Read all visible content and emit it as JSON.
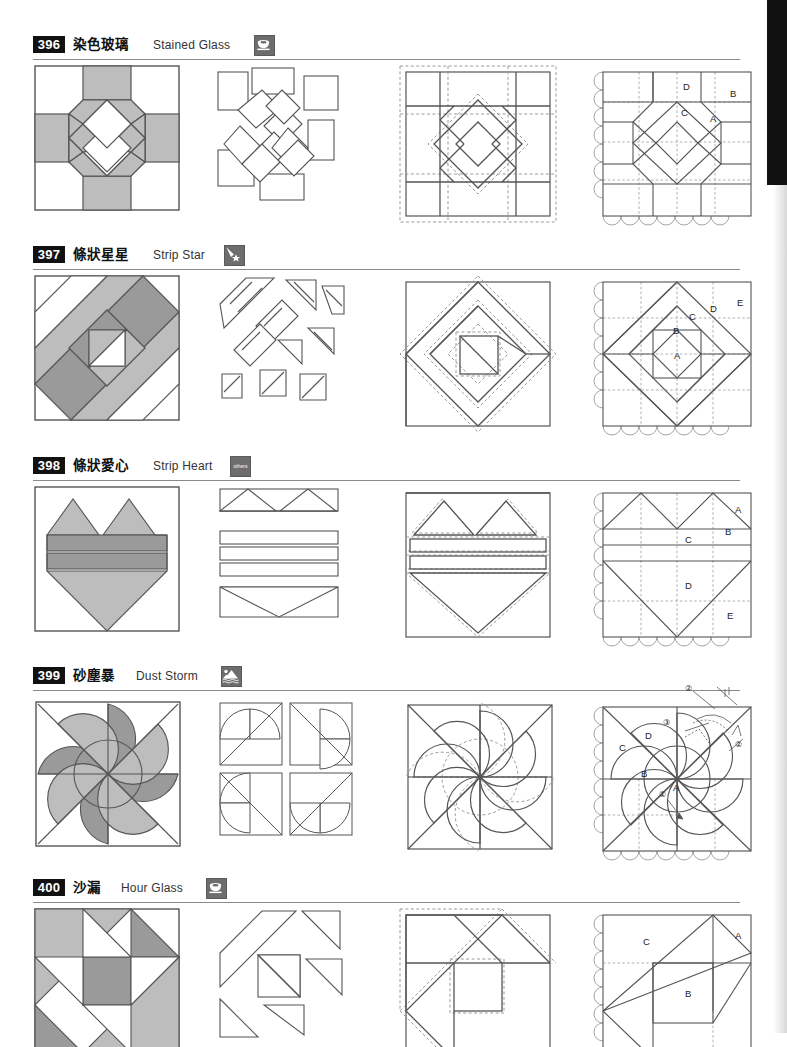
{
  "page": {
    "width": 787,
    "height": 1033,
    "edge_tab_color": "#111111",
    "palette": {
      "fill_light": "#ffffff",
      "fill_mid": "#bdbdbd",
      "fill_dark": "#9a9a9a",
      "fill_darker": "#8a8a8a",
      "outline": "#555555",
      "badge_bg": "#111111",
      "icon_bg": "#6d6d6d",
      "rule": "#8a8a8a",
      "dashed": "#9b9b9b"
    },
    "columns": [
      {
        "name": "finished-block",
        "caption": ""
      },
      {
        "name": "exploded-pieces",
        "caption": ""
      },
      {
        "name": "seam-allowance",
        "caption": ""
      },
      {
        "name": "labeled-template",
        "caption": ""
      }
    ]
  },
  "patterns": [
    {
      "number": "396",
      "name_cn": "染色玻璃",
      "name_en": "Stained Glass",
      "category_icon": "cup-icon",
      "category_label": "",
      "labels": [
        "A",
        "B",
        "C",
        "D"
      ],
      "step_marks": []
    },
    {
      "number": "397",
      "name_cn": "條狀星星",
      "name_en": "Strip Star",
      "category_icon": "shooting-star-icon",
      "category_label": "",
      "labels": [
        "A",
        "B",
        "C",
        "D",
        "E"
      ],
      "step_marks": []
    },
    {
      "number": "398",
      "name_cn": "條狀愛心",
      "name_en": "Strip Heart",
      "category_icon": "others-icon",
      "category_label": "others",
      "labels": [
        "A",
        "B",
        "C",
        "D",
        "E"
      ],
      "step_marks": []
    },
    {
      "number": "399",
      "name_cn": "砂塵暴",
      "name_en": "Dust Storm",
      "category_icon": "landscape-icon",
      "category_label": "",
      "labels": [
        "A",
        "B",
        "C",
        "D"
      ],
      "step_marks": [
        "①",
        "②",
        "②",
        "③"
      ]
    },
    {
      "number": "400",
      "name_cn": "沙漏",
      "name_en": "Hour Glass",
      "category_icon": "cup-icon",
      "category_label": "",
      "labels": [
        "A",
        "B",
        "C"
      ],
      "step_marks": []
    }
  ]
}
